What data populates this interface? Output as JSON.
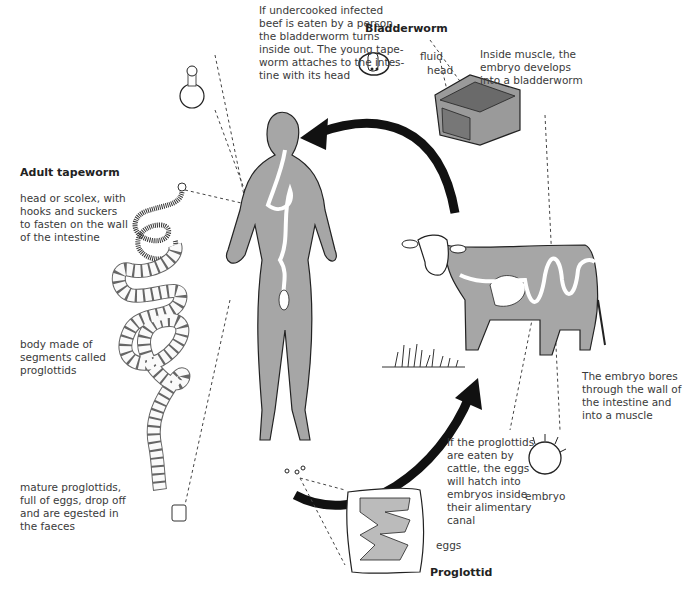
{
  "diagram": {
    "headings": {
      "bladderworm": "Bladderworm",
      "adult_tapeworm": "Adult tapeworm",
      "proglottid": "Proglottid"
    },
    "labels": {
      "human_infection": "If undercooked infected\nbeef is eaten by a person,\nthe bladderworm turns\ninside out. The young tape-\nworm attaches to the intes-\ntine with its head",
      "fluid": "fluid",
      "head": "head",
      "inside_muscle": "Inside muscle, the\nembryo develops\ninto a bladderworm",
      "scolex": "head or scolex, with\nhooks and suckers\nto fasten on the wall\nof the intestine",
      "body_segments": "body made of\nsegments called\nproglottids",
      "mature_proglottids": "mature proglottids,\nfull of eggs, drop off\nand are egested in\nthe faeces",
      "embryo_bores": "The embryo bores\nthrough the wall of\nthe intestine and\ninto a muscle",
      "cattle_eat": "If the proglottids\nare eaten by\ncattle, the eggs\nwill hatch into\nembryos inside\ntheir alimentary\ncanal",
      "embryo": "embryo",
      "eggs": "eggs"
    },
    "nodes": [
      "bladderworm",
      "human host",
      "adult tapeworm",
      "proglottid",
      "eggs",
      "cattle host",
      "embryo"
    ],
    "edges": [
      {
        "from": "cattle host (beef muscle)",
        "to": "human host",
        "style": "thick-arrow"
      },
      {
        "from": "proglottid / eggs",
        "to": "cattle host",
        "style": "thick-arrow"
      }
    ],
    "colors": {
      "body_fill": "#a6a6a6",
      "outline": "#222222",
      "arrow": "#111111",
      "text": "#3a3a3a"
    }
  }
}
